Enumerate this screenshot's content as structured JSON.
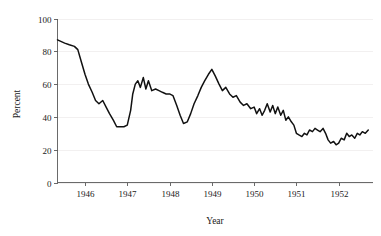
{
  "chart_data": {
    "type": "line",
    "title": "",
    "subtitle": "",
    "xlabel": "Year",
    "ylabel": "Percent",
    "xlim": [
      1945.35,
      1952.8
    ],
    "ylim": [
      0,
      100
    ],
    "grid": true,
    "grid_axis": "y",
    "legend": false,
    "legend_position": "none",
    "xticks": [
      1946,
      1947,
      1948,
      1949,
      1950,
      1951,
      1952
    ],
    "xtick_labels": [
      "1946",
      "1947",
      "1948",
      "1949",
      "1950",
      "1951",
      "1952"
    ],
    "yticks": [
      0,
      20,
      40,
      60,
      80,
      100
    ],
    "ytick_labels": [
      "0",
      "20",
      "40",
      "60",
      "80",
      "100"
    ],
    "line_color": "#111111",
    "grid_color": "#eceaea",
    "axis_color": "#5a5a5a",
    "series": [
      {
        "name": "Percent",
        "x": [
          1945.35,
          1945.52,
          1945.63,
          1945.75,
          1945.83,
          1945.92,
          1946.0,
          1946.08,
          1946.17,
          1946.25,
          1946.33,
          1946.42,
          1946.5,
          1946.58,
          1946.67,
          1946.75,
          1946.83,
          1946.92,
          1947.0,
          1947.08,
          1947.13,
          1947.19,
          1947.25,
          1947.31,
          1947.38,
          1947.44,
          1947.5,
          1947.58,
          1947.67,
          1947.75,
          1947.83,
          1947.92,
          1948.0,
          1948.08,
          1948.17,
          1948.25,
          1948.33,
          1948.42,
          1948.5,
          1948.58,
          1948.67,
          1948.75,
          1948.83,
          1948.92,
          1949.0,
          1949.08,
          1949.17,
          1949.25,
          1949.33,
          1949.42,
          1949.5,
          1949.58,
          1949.67,
          1949.75,
          1949.83,
          1949.92,
          1950.0,
          1950.06,
          1950.13,
          1950.19,
          1950.25,
          1950.31,
          1950.38,
          1950.44,
          1950.5,
          1950.56,
          1950.63,
          1950.69,
          1950.75,
          1950.81,
          1950.88,
          1950.94,
          1951.0,
          1951.06,
          1951.13,
          1951.19,
          1951.25,
          1951.31,
          1951.38,
          1951.44,
          1951.5,
          1951.56,
          1951.63,
          1951.69,
          1951.75,
          1951.81,
          1951.88,
          1951.94,
          1952.0,
          1952.06,
          1952.13,
          1952.19,
          1952.25,
          1952.31,
          1952.38,
          1952.44,
          1952.5,
          1952.56,
          1952.63,
          1952.7
        ],
        "values": [
          87,
          85,
          84,
          83,
          81,
          73,
          66,
          60,
          55,
          50,
          48,
          50,
          46,
          42,
          38,
          34,
          34,
          34,
          35,
          44,
          54,
          60,
          62,
          58,
          64,
          57,
          62,
          56,
          57,
          56,
          55,
          54,
          54,
          53,
          47,
          41,
          36,
          37,
          42,
          48,
          53,
          58,
          62,
          66,
          69,
          65,
          60,
          56,
          58,
          54,
          52,
          53,
          49,
          47,
          48,
          45,
          46,
          42,
          45,
          41,
          44,
          48,
          43,
          47,
          42,
          46,
          41,
          44,
          38,
          40,
          37,
          35,
          30,
          29,
          28,
          30,
          29,
          32,
          31,
          33,
          32,
          31,
          33,
          30,
          26,
          24,
          25,
          23,
          24,
          27,
          26,
          30,
          28,
          29,
          27,
          30,
          29,
          31,
          30,
          32
        ]
      }
    ]
  },
  "accessibility": {
    "chart_description": "Line chart of Percent versus Year from 1945 to 1952"
  }
}
